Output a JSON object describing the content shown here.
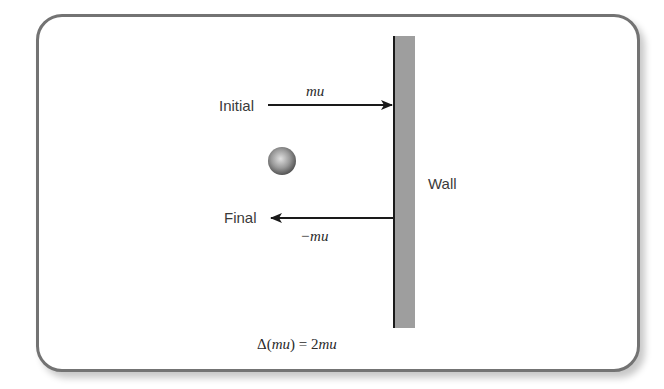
{
  "diagram": {
    "labels": {
      "initial": "Initial",
      "final": "Final",
      "wall": "Wall",
      "initial_momentum": "mu",
      "final_momentum": "−mu",
      "equation_delta": "Δ(",
      "equation_mu": "mu",
      "equation_close": ") = ",
      "equation_two": "2",
      "equation_mu2": "mu"
    },
    "equation_full": "Δ(mu) = 2mu",
    "arrows": [
      {
        "name": "initial",
        "direction": "right",
        "label": "mu"
      },
      {
        "name": "final",
        "direction": "left",
        "label": "−mu"
      }
    ],
    "colors": {
      "frame_border": "#737373",
      "wall_fill": "#9e9e9e",
      "wall_edge": "#1a1a1a",
      "arrow": "#1a1a1a",
      "ball_light": "#d8d8d8",
      "ball_dark": "#555555"
    }
  }
}
